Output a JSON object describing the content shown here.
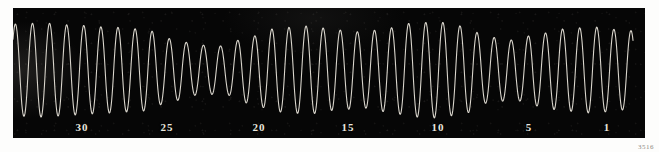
{
  "figure": {
    "plate_number": "3516",
    "background_color": "#fdfdfc",
    "plate_color": "#060606",
    "trace_color": "#d9d5cc",
    "label_color": "#e9e6df"
  },
  "axis": {
    "tick_labels": [
      {
        "text": "30",
        "x": 82
      },
      {
        "text": "25",
        "x": 167
      },
      {
        "text": "20",
        "x": 259
      },
      {
        "text": "15",
        "x": 348
      },
      {
        "text": "10",
        "x": 438
      },
      {
        "text": "5",
        "x": 529
      },
      {
        "text": "1",
        "x": 607
      }
    ]
  },
  "chart_data": {
    "type": "line",
    "title": "",
    "subtitle": "",
    "xlabel": "",
    "ylabel": "",
    "grid": false,
    "legend": null,
    "xlim": [
      0,
      632
    ],
    "ylim": [
      0,
      130
    ],
    "x_axis_direction": "right-to-left",
    "x_tick_values": [
      30,
      25,
      20,
      15,
      10,
      5,
      1
    ],
    "x_tick_pixel_positions": [
      82,
      167,
      259,
      348,
      438,
      529,
      607
    ],
    "series": [
      {
        "name": "oscillation-trace",
        "color": "#d9d5cc",
        "waveform": {
          "model": "amplitude-modulated-sine",
          "baseline_y": 62,
          "carrier_cycles": 36,
          "carrier_period_px": 17.1,
          "amplitude_max_px": 48,
          "amplitude_min_px": 22,
          "beat_count": 4,
          "beat_period_px": 158,
          "beat_phase_deg": 40,
          "start_x": 0,
          "end_x": 620,
          "sample_count": 1400,
          "line_width_px": 1.1,
          "amplitude_envelope_nodes": [
            {
              "x": 0,
              "amplitude": 46
            },
            {
              "x": 30,
              "amplitude": 47
            },
            {
              "x": 60,
              "amplitude": 45
            },
            {
              "x": 95,
              "amplitude": 43
            },
            {
              "x": 130,
              "amplitude": 41
            },
            {
              "x": 160,
              "amplitude": 31
            },
            {
              "x": 185,
              "amplitude": 25
            },
            {
              "x": 210,
              "amplitude": 24
            },
            {
              "x": 235,
              "amplitude": 33
            },
            {
              "x": 265,
              "amplitude": 42
            },
            {
              "x": 295,
              "amplitude": 44
            },
            {
              "x": 325,
              "amplitude": 40
            },
            {
              "x": 350,
              "amplitude": 38
            },
            {
              "x": 375,
              "amplitude": 42
            },
            {
              "x": 400,
              "amplitude": 47
            },
            {
              "x": 425,
              "amplitude": 48
            },
            {
              "x": 450,
              "amplitude": 44
            },
            {
              "x": 475,
              "amplitude": 33
            },
            {
              "x": 500,
              "amplitude": 30
            },
            {
              "x": 525,
              "amplitude": 36
            },
            {
              "x": 550,
              "amplitude": 41
            },
            {
              "x": 580,
              "amplitude": 43
            },
            {
              "x": 610,
              "amplitude": 40
            },
            {
              "x": 632,
              "amplitude": 38
            }
          ]
        }
      }
    ]
  }
}
